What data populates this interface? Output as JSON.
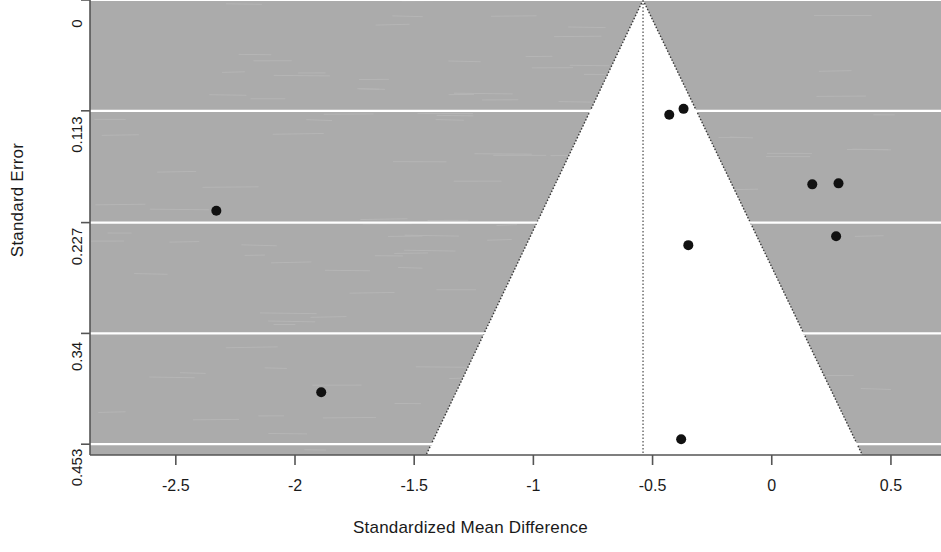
{
  "chart_data": {
    "type": "scatter",
    "title": "",
    "subtitle": "",
    "xlabel": "Standardized Mean Difference",
    "ylabel": "Standard Error",
    "xlim": [
      -2.86,
      0.71
    ],
    "ylim": [
      0.464,
      0.0
    ],
    "y_axis_inverted": true,
    "grid": true,
    "grid_color": "#ffffff",
    "plot_background": "#ababab",
    "funnel_background": "#ffffff",
    "legend": null,
    "xticks": [
      -2.5,
      -2,
      -1.5,
      -1,
      -0.5,
      0,
      0.5
    ],
    "xtick_labels": [
      "-2.5",
      "-2",
      "-1.5",
      "-1",
      "-0.5",
      "0",
      "0.5"
    ],
    "yticks": [
      0,
      0.113,
      0.227,
      0.34,
      0.453
    ],
    "ytick_labels": [
      "0",
      "0.113",
      "0.227",
      "0.34",
      "0.453"
    ],
    "reference_line": {
      "type": "vertical-dotted",
      "x": -0.54,
      "label": "pooled effect estimate"
    },
    "funnel_contour": {
      "apex_x": -0.54,
      "apex_y": 0,
      "left_base_x": -1.45,
      "right_base_x": 0.38,
      "base_y": 0.464,
      "style": "dotted"
    },
    "point_color": "#111111",
    "point_size": 5,
    "points": [
      {
        "x": -2.33,
        "y": 0.215
      },
      {
        "x": -1.89,
        "y": 0.4
      },
      {
        "x": -0.43,
        "y": 0.117
      },
      {
        "x": -0.37,
        "y": 0.111
      },
      {
        "x": -0.35,
        "y": 0.25
      },
      {
        "x": -0.38,
        "y": 0.448
      },
      {
        "x": 0.17,
        "y": 0.188
      },
      {
        "x": 0.28,
        "y": 0.187
      },
      {
        "x": 0.27,
        "y": 0.241
      }
    ]
  }
}
